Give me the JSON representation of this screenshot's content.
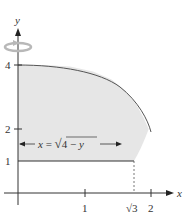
{
  "figure": {
    "type": "region of revolution diagram",
    "axes": {
      "x_label": "x",
      "y_label": "y",
      "x_ticks": [
        "1",
        "√3",
        "2"
      ],
      "y_ticks": [
        "1",
        "2",
        "4"
      ]
    },
    "curve_label": "x = √4 − y",
    "curve_label_parts": {
      "lhs": "x =",
      "radical": "√",
      "radicand": "4 − y"
    },
    "rotation_axis": "y",
    "region": {
      "bounded_by": [
        "y-axis",
        "y = 1",
        "x = √(4 − y)"
      ],
      "y_range": [
        1,
        4
      ]
    },
    "colors": {
      "region_fill": "#e6e6e6",
      "curve": "#555555",
      "axis": "#333333",
      "rotation_arrow": "#b8b8b8"
    }
  }
}
